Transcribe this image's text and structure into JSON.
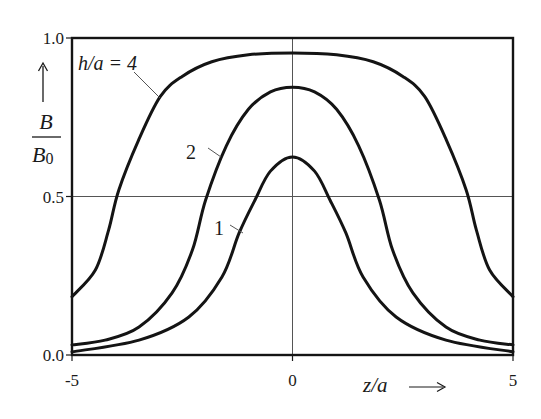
{
  "chart_data": {
    "type": "line",
    "title": "",
    "xlabel": "z/a",
    "ylabel": "B/B0",
    "xlim": [
      -5,
      5
    ],
    "ylim": [
      0,
      1
    ],
    "x_ticks": [
      {
        "value": -5,
        "label": "-5"
      },
      {
        "value": 0,
        "label": "0"
      },
      {
        "value": 5,
        "label": "5"
      }
    ],
    "y_ticks": [
      {
        "value": 0.0,
        "label": "0.0"
      },
      {
        "value": 0.5,
        "label": "0.5"
      },
      {
        "value": 1.0,
        "label": "1.0"
      }
    ],
    "reference_lines": {
      "horizontal": [
        0.5
      ],
      "vertical": [
        0
      ]
    },
    "grid": false,
    "symmetric_about_x0": true,
    "series": [
      {
        "name": "h/a = 4",
        "label": "h/a = 4",
        "x": [
          -5,
          -4.47,
          -4.17,
          -3.94,
          -3.49,
          -3.0,
          -2.51,
          -1.83,
          -1.0,
          0,
          1.0,
          1.83,
          2.51,
          3.0,
          3.49,
          3.94,
          4.17,
          4.47,
          5
        ],
        "values": [
          0.184,
          0.268,
          0.394,
          0.52,
          0.678,
          0.815,
          0.878,
          0.925,
          0.947,
          0.953,
          0.947,
          0.925,
          0.878,
          0.815,
          0.678,
          0.52,
          0.394,
          0.268,
          0.184
        ]
      },
      {
        "name": "h/a = 2",
        "label": "2",
        "x": [
          -5,
          -4.25,
          -3.48,
          -2.73,
          -2.27,
          -1.97,
          -1.5,
          -1.0,
          -0.5,
          0,
          0.5,
          1.0,
          1.5,
          1.97,
          2.27,
          2.73,
          3.48,
          4.25,
          5
        ],
        "values": [
          0.032,
          0.047,
          0.088,
          0.196,
          0.331,
          0.489,
          0.66,
          0.775,
          0.83,
          0.845,
          0.83,
          0.775,
          0.66,
          0.489,
          0.331,
          0.196,
          0.088,
          0.047,
          0.032
        ]
      },
      {
        "name": "h/a = 1",
        "label": "1",
        "x": [
          -5,
          -3.48,
          -2.35,
          -1.6,
          -1.21,
          -0.85,
          -0.5,
          0,
          0.5,
          0.85,
          1.21,
          1.6,
          2.35,
          3.48,
          5
        ],
        "values": [
          0.01,
          0.047,
          0.12,
          0.246,
          0.385,
          0.489,
          0.58,
          0.625,
          0.58,
          0.489,
          0.385,
          0.246,
          0.12,
          0.047,
          0.01
        ]
      }
    ],
    "annotations": [
      {
        "text": "h/a = 4",
        "series": "h/a = 4",
        "has_leader_line": true
      },
      {
        "text": "2",
        "series": "h/a = 2",
        "has_leader_line": true
      },
      {
        "text": "1",
        "series": "h/a = 1",
        "has_leader_line": true
      }
    ],
    "legend": "inline labels with leader lines"
  },
  "labels": {
    "y_numerator": "B",
    "y_denominator": "B",
    "y_denominator_sub": "0",
    "y_arrow": "↑",
    "x_var": "z/a",
    "x_arrow": "⟶",
    "curve4_h": "h",
    "curve4_rest": "/a = 4",
    "curve2": "2",
    "curve1": "1"
  },
  "colors": {
    "curve": "#141414",
    "frame": "#141414",
    "reference_line": "#555555",
    "background": "#ffffff"
  }
}
